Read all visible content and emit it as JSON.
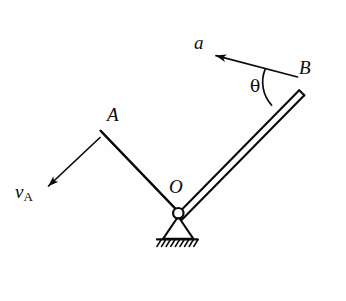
{
  "figure": {
    "type": "mechanics-diagram",
    "background_color": "#fefefe",
    "stroke_color": "#0b0b0b",
    "labels": {
      "point_a": "A",
      "point_b": "B",
      "pivot_o": "O",
      "acceleration": "a",
      "angle": "θ",
      "velocity_symbol": "v",
      "velocity_subscript": "A"
    },
    "geometry": {
      "pivot": {
        "x": 178,
        "y": 212
      },
      "end_a": {
        "x": 103,
        "y": 133
      },
      "end_b": {
        "x": 302,
        "y": 87
      },
      "bar_thickness": 5,
      "velocity_arrow": {
        "from_x": 100,
        "from_y": 138,
        "to_x": 45,
        "to_y": 190
      },
      "acceleration_arrow": {
        "from_x": 297,
        "from_y": 77,
        "to_x": 213,
        "to_y": 55
      },
      "angle_arc_radius": 34,
      "support_base_y": 239,
      "support_base_x1": 157,
      "support_base_x2": 197,
      "hatch_count": 9
    }
  }
}
